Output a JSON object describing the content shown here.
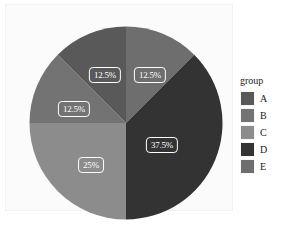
{
  "chart_data": {
    "type": "pie",
    "title": "",
    "legend_title": "group",
    "legend_position": "right",
    "categories": [
      "A",
      "B",
      "C",
      "D",
      "E"
    ],
    "values": [
      12.5,
      12.5,
      25,
      37.5,
      12.5
    ],
    "labels": [
      "12.5%",
      "12.5%",
      "25%",
      "37.5%",
      "12.5%"
    ],
    "colors": [
      "#595959",
      "#737373",
      "#8c8c8c",
      "#333333",
      "#6e6e6e"
    ],
    "slices": [
      {
        "group": "A",
        "label": "12.5%",
        "value": 12.5,
        "color": "#595959",
        "start_deg": 315,
        "end_deg": 360
      },
      {
        "group": "B",
        "label": "12.5%",
        "value": 12.5,
        "color": "#737373",
        "start_deg": 270,
        "end_deg": 315
      },
      {
        "group": "C",
        "label": "25%",
        "value": 25.0,
        "color": "#8c8c8c",
        "start_deg": 180,
        "end_deg": 270
      },
      {
        "group": "D",
        "label": "37.5%",
        "value": 37.5,
        "color": "#333333",
        "start_deg": 45,
        "end_deg": 180
      },
      {
        "group": "E",
        "label": "12.5%",
        "value": 12.5,
        "color": "#6e6e6e",
        "start_deg": 0,
        "end_deg": 45
      }
    ],
    "xlabel": "",
    "ylabel": "",
    "grid": false,
    "panel_color": "#fbfbfb",
    "label_text_color": "#ffffff"
  },
  "legend": {
    "title": "group",
    "items": [
      {
        "label": "A",
        "color": "#595959"
      },
      {
        "label": "B",
        "color": "#737373"
      },
      {
        "label": "C",
        "color": "#8c8c8c"
      },
      {
        "label": "D",
        "color": "#333333"
      },
      {
        "label": "E",
        "color": "#6e6e6e"
      }
    ]
  },
  "pie_labels": {
    "top_left": "12.5%",
    "top_right": "12.5%",
    "left": "12.5%",
    "bottom_left": "25%",
    "right": "37.5%"
  }
}
